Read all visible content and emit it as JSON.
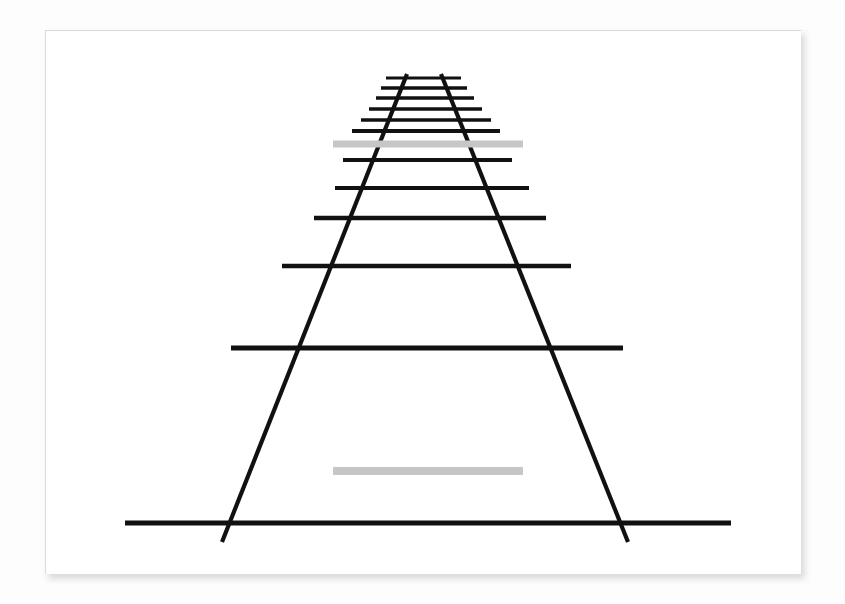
{
  "figure": {
    "title": "Ponzo illusion (railroad track illusion)",
    "caption": ""
  },
  "canvas": {
    "width": 845,
    "height": 604,
    "background_color": "#fdfdfd"
  },
  "card": {
    "x": 45,
    "y": 30,
    "width": 755,
    "height": 543,
    "background_color": "#ffffff",
    "shadow_color": "#cfcfcf"
  },
  "chart_data": {
    "type": "diagram",
    "title": "Ponzo illusion (railroad track illusion)",
    "xlabel": "",
    "ylabel": "",
    "xlim": [
      0,
      845
    ],
    "ylim": [
      0,
      604
    ],
    "grid": false,
    "legend": "none",
    "stroke_color": "#111111",
    "bar_color": "#c6c6c6",
    "apex": {
      "x": 424,
      "y": 70
    },
    "rails": [
      {
        "name": "left-rail",
        "x1": 407,
        "y1": 74,
        "x2": 222,
        "y2": 542,
        "width": 4.2
      },
      {
        "name": "right-rail",
        "x1": 441,
        "y1": 74,
        "x2": 628,
        "y2": 542,
        "width": 4.2
      }
    ],
    "ties": [
      {
        "index": 1,
        "y": 78,
        "x1": 386,
        "x2": 461,
        "width": 3.2
      },
      {
        "index": 2,
        "y": 88,
        "x1": 381,
        "x2": 467,
        "width": 3.3
      },
      {
        "index": 3,
        "y": 98,
        "x1": 376,
        "x2": 474,
        "width": 3.4
      },
      {
        "index": 4,
        "y": 109,
        "x1": 369,
        "x2": 482,
        "width": 3.6
      },
      {
        "index": 5,
        "y": 120,
        "x1": 361,
        "x2": 491,
        "width": 3.7
      },
      {
        "index": 6,
        "y": 131,
        "x1": 352,
        "x2": 500,
        "width": 3.8
      },
      {
        "index": 7,
        "y": 160,
        "x1": 343,
        "x2": 512,
        "width": 4.0
      },
      {
        "index": 8,
        "y": 188,
        "x1": 335,
        "x2": 529,
        "width": 4.2
      },
      {
        "index": 9,
        "y": 218,
        "x1": 314,
        "x2": 546,
        "width": 4.4
      },
      {
        "index": 10,
        "y": 266,
        "x1": 282,
        "x2": 571,
        "width": 4.6
      },
      {
        "index": 11,
        "y": 348,
        "x1": 231,
        "x2": 623,
        "width": 5.0
      },
      {
        "index": 12,
        "y": 523,
        "x1": 125,
        "x2": 731,
        "width": 5.2
      }
    ],
    "gray_bars": [
      {
        "name": "upper-gray-bar",
        "label": "far bar",
        "x1": 333,
        "x2": 523,
        "y": 144,
        "length": 190,
        "thickness": 7,
        "color": "#c6c6c6"
      },
      {
        "name": "lower-gray-bar",
        "label": "near bar",
        "x1": 333,
        "x2": 523,
        "y": 471,
        "length": 190,
        "thickness": 8,
        "color": "#c6c6c6"
      }
    ]
  }
}
